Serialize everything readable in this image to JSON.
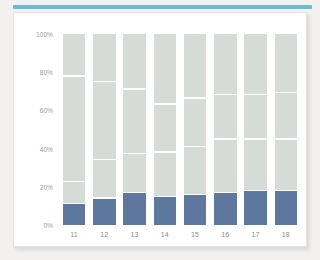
{
  "accent": {
    "color": "#6cb9d6"
  },
  "card": {
    "background": "#ffffff",
    "border_color": "#e3e2e0"
  },
  "chart_data": {
    "type": "bar",
    "subtype": "stacked-percentage-column",
    "title": "",
    "subtitle": "",
    "xlabel": "",
    "ylabel": "",
    "categories": [
      "11",
      "12",
      "13",
      "14",
      "15",
      "16",
      "17",
      "18"
    ],
    "ylim": [
      0,
      100
    ],
    "ytick_labels": [
      "0%",
      "20%",
      "40%",
      "60%",
      "80%",
      "100%"
    ],
    "ytick_values": [
      0,
      20,
      40,
      60,
      80,
      100
    ],
    "grid": false,
    "legend": "none",
    "colors": {
      "highlight_series": "#5d779e",
      "other_series": "#d6dbd8",
      "segment_divider": "#ffffff"
    },
    "series": [
      {
        "name": "bottom-highlight",
        "color": "#5d779e",
        "values": [
          11,
          14,
          17,
          15,
          16,
          17,
          18,
          18
        ]
      },
      {
        "name": "segment-2",
        "color": "#d6dbd8",
        "values": [
          11,
          20,
          20,
          23,
          25,
          28,
          27,
          27
        ]
      },
      {
        "name": "segment-3",
        "color": "#d6dbd8",
        "values": [
          56,
          41,
          34,
          25,
          25,
          23,
          23,
          24
        ]
      },
      {
        "name": "segment-4",
        "color": "#d6dbd8",
        "values": [
          22,
          25,
          29,
          37,
          34,
          32,
          32,
          31
        ]
      }
    ],
    "stack_tops": {
      "11": [
        11,
        22,
        78,
        100
      ],
      "12": [
        14,
        34,
        75,
        100
      ],
      "13": [
        17,
        37,
        71,
        100
      ],
      "14": [
        15,
        38,
        63,
        100
      ],
      "15": [
        16,
        41,
        66,
        100
      ],
      "16": [
        17,
        45,
        68,
        100
      ],
      "17": [
        18,
        45,
        68,
        100
      ],
      "18": [
        18,
        45,
        69,
        100
      ]
    }
  }
}
